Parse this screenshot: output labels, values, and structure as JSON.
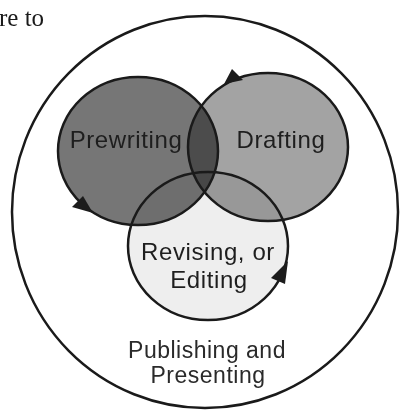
{
  "page_fragment": {
    "text": "re to"
  },
  "diagram": {
    "outer_circle": {
      "label_line1": "Publishing and",
      "label_line2": "Presenting",
      "fill": "#ffffff"
    },
    "circles": [
      {
        "id": "prewriting",
        "label": "Prewriting",
        "fill": "#767676"
      },
      {
        "id": "drafting",
        "label": "Drafting",
        "fill": "#a3a3a3"
      },
      {
        "id": "revising",
        "label_line1": "Revising, or",
        "label_line2": "Editing",
        "fill": "#eeeeee"
      }
    ],
    "arrows": [
      {
        "on": "prewriting",
        "position": "lower-left"
      },
      {
        "on": "drafting",
        "position": "upper-left"
      },
      {
        "on": "revising",
        "position": "lower-right"
      }
    ],
    "colors": {
      "outline": "#1a1a1a",
      "text": "#1e1e1e"
    }
  }
}
